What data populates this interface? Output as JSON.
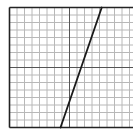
{
  "chart_data": {
    "type": "line",
    "title": "",
    "xlabel": "",
    "ylabel": "",
    "grid": true,
    "xlim": [
      -8,
      8
    ],
    "ylim": [
      -8,
      8
    ],
    "grid_step": 1,
    "axes_emphasized": true,
    "series": [
      {
        "name": "line",
        "points": [
          [
            -1.2,
            -8
          ],
          [
            4.3,
            8
          ]
        ]
      }
    ],
    "colors": {
      "grid": "#b8b8b8",
      "axis": "#555555",
      "frame": "#222222",
      "line": "#1a1a1a",
      "background": "#ffffff"
    }
  }
}
